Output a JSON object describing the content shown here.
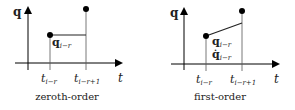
{
  "panels": [
    {
      "caption": "zeroth-order",
      "y_axis_label": "q",
      "x_axis_label": "t",
      "tick_labels": [
        {
          "base": "t",
          "sub": "i−r"
        },
        {
          "base": "t",
          "sub": "i−r+1"
        }
      ],
      "annotations": [
        {
          "base": "q",
          "sub": "i−r",
          "dotted": false
        }
      ]
    },
    {
      "caption": "first-order",
      "y_axis_label": "q",
      "x_axis_label": "t",
      "tick_labels": [
        {
          "base": "t",
          "sub": "i−r"
        },
        {
          "base": "t",
          "sub": "i−r+1"
        }
      ],
      "annotations": [
        {
          "base": "q",
          "sub": "i−r",
          "dotted": false
        },
        {
          "base": "q̇",
          "sub": "i−r",
          "dotted": true
        }
      ]
    }
  ],
  "colors": {
    "stroke": "#000000",
    "text": "#222222",
    "guide": "#555555",
    "background": "#ffffff"
  }
}
